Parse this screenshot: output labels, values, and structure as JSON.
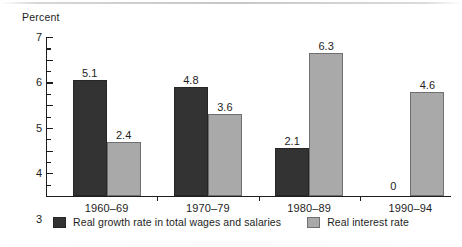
{
  "chart_data": {
    "type": "bar",
    "title": "",
    "ylabel": "Percent",
    "xlabel": "",
    "ylim": [
      0,
      7
    ],
    "ytick_labels": [
      "0",
      "1",
      "2",
      "3",
      "4",
      "5",
      "6",
      "7"
    ],
    "ytick_values": [
      0,
      1,
      2,
      3,
      4,
      5,
      6,
      7
    ],
    "minor_tick_step": 0.5,
    "grid": false,
    "legend_position": "bottom",
    "categories": [
      "1960–69",
      "1970–79",
      "1980–89",
      "1990–94"
    ],
    "series": [
      {
        "name": "Real growth rate in total wages and salaries",
        "color": "#333333",
        "values": [
          5.1,
          4.8,
          2.1,
          0
        ],
        "labels": [
          "5.1",
          "4.8",
          "2.1",
          "0"
        ]
      },
      {
        "name": "Real interest rate",
        "color": "#a9a9a9",
        "values": [
          2.4,
          3.6,
          6.3,
          4.6
        ],
        "labels": [
          "2.4",
          "3.6",
          "6.3",
          "4.6"
        ]
      }
    ]
  },
  "axis": {
    "y_title": "Percent"
  },
  "legend": {
    "items": [
      {
        "label": "Real growth rate in total wages and salaries",
        "swatch": "dark-swatch-icon"
      },
      {
        "label": "Real interest rate",
        "swatch": "light-swatch-icon"
      }
    ]
  }
}
